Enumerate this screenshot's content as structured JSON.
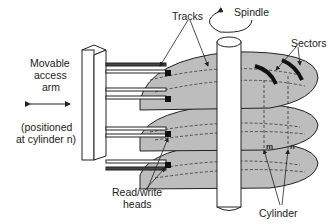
{
  "diagram": {
    "labels": {
      "tracks": "Tracks",
      "spindle": "Spindle",
      "sectors": "Sectors",
      "arm_line1": "Movable",
      "arm_line2": "access",
      "arm_line3": "arm",
      "positioned_line1": "(positioned",
      "positioned_line2": "at cylinder n)",
      "heads_line1": "Read/write",
      "heads_line2": "heads",
      "cylinder": "Cylinder",
      "marker_m": "m",
      "marker_n": "n"
    },
    "colors": {
      "platter": "#bdbdbd",
      "outline": "#222222",
      "background": "#ffffff"
    },
    "platter_count": 3
  }
}
